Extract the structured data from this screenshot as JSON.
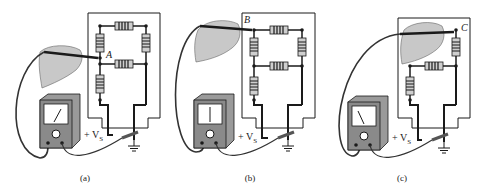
{
  "figure": {
    "panels": [
      {
        "id": "a",
        "caption": "(a)",
        "probe_node": "A",
        "meter_needle": "right-tilt",
        "supply_label": "+ V",
        "supply_subscript": "S"
      },
      {
        "id": "b",
        "caption": "(b)",
        "probe_node": "B",
        "meter_needle": "vertical",
        "supply_label": "+ V",
        "supply_subscript": "S"
      },
      {
        "id": "c",
        "caption": "(c)",
        "probe_node": "C",
        "meter_needle": "left-tilt",
        "supply_label": "+ V",
        "supply_subscript": "S"
      }
    ],
    "meter_terminals": {
      "positive": "+",
      "negative": "−"
    },
    "colors": {
      "ink": "#1a1a1a",
      "meter_body": "#9a9a9a",
      "meter_face": "#ffffff",
      "resistor_body": "#cfcfcf",
      "hand": "#c8c8c8"
    }
  }
}
